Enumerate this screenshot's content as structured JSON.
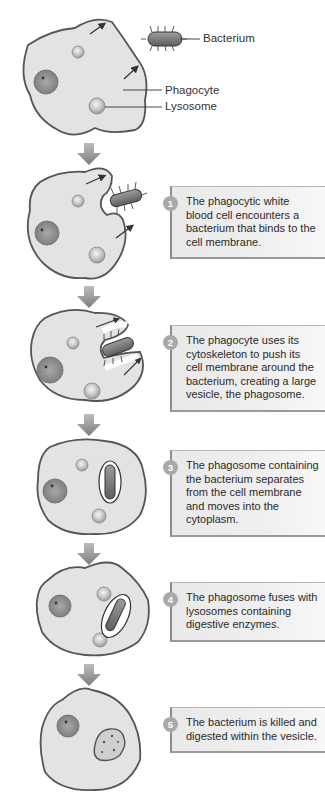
{
  "diagram": {
    "labels": {
      "bacterium": "Bacterium",
      "phagocyte": "Phagocyte",
      "lysosome": "Lysosome"
    },
    "steps": [
      {
        "number": "1",
        "text": "The phagocytic white blood cell encounters a bacterium that binds to the cell membrane."
      },
      {
        "number": "2",
        "text": "The phagocyte uses its cytoskeleton to push its cell membrane around the bacterium, creating a large vesicle, the phagosome."
      },
      {
        "number": "3",
        "text": "The phagosome containing the bacterium separates from the cell membrane and moves into the cytoplasm."
      },
      {
        "number": "4",
        "text": "The phagosome fuses with lysosomes containing digestive enzymes."
      },
      {
        "number": "5",
        "text": "The bacterium is killed and digested within the vesicle."
      }
    ],
    "colors": {
      "cell_fill": "#e3e3e3",
      "cell_outline": "#555555",
      "nucleus": "#8f8f8f",
      "lysosome": "#b5b5b5",
      "bacterium": "#7a7a7a",
      "flow_arrow": "#8a8a8a",
      "box_border": "#8d8d8d",
      "badge": "#a9a9a9"
    }
  }
}
